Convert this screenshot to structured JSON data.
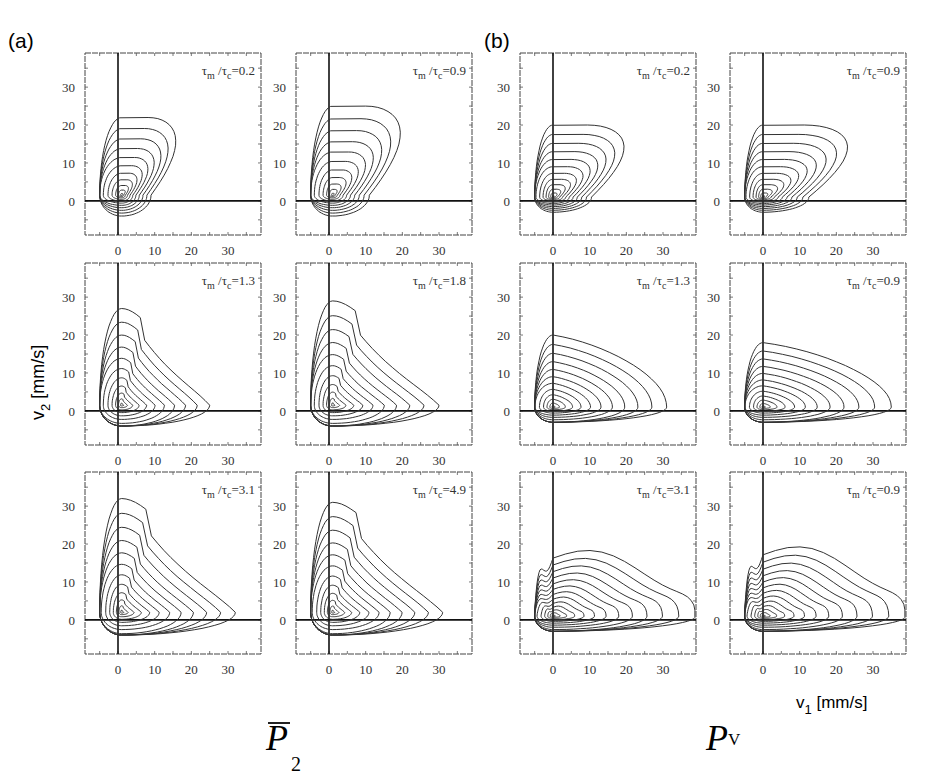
{
  "figure": {
    "panel_a_label": "(a)",
    "panel_b_label": "(b)",
    "ylabel": "v",
    "ylabel_sub": "2",
    "ylabel_unit": " [mm/s]",
    "xlabel": "v",
    "xlabel_sub": "1",
    "xlabel_unit": " [mm/s]",
    "group_a_symbol": "P",
    "group_a_sub": "2",
    "group_b_symbol": "P",
    "group_b_sub": "V"
  },
  "chart_data": {
    "type": "contour",
    "xlim": [
      -9,
      39
    ],
    "ylim": [
      -9,
      39
    ],
    "xticks": [
      0,
      10,
      20,
      30
    ],
    "yticks": [
      0,
      10,
      20,
      30
    ],
    "grid": false,
    "axes_lines": {
      "x": 0,
      "y": 0
    },
    "panels": [
      {
        "group": "a",
        "row": 0,
        "col": 0,
        "title_prefix": "τm/τc=",
        "ratio": "0.2",
        "peak": [
          1,
          1.5
        ],
        "outer": {
          "xmin": -5,
          "xmax": 17,
          "ymin": -4,
          "ymax": 22
        },
        "levels": 11,
        "shape": "diag"
      },
      {
        "group": "a",
        "row": 0,
        "col": 1,
        "title_prefix": "τm/τc=",
        "ratio": "0.9",
        "peak": [
          1,
          1.5
        ],
        "outer": {
          "xmin": -5,
          "xmax": 21,
          "ymin": -4,
          "ymax": 25
        },
        "levels": 11,
        "shape": "diag"
      },
      {
        "group": "a",
        "row": 1,
        "col": 0,
        "title_prefix": "τm/τc=",
        "ratio": "1.3",
        "peak": [
          1,
          1.5
        ],
        "outer": {
          "xmin": -5,
          "xmax": 25,
          "ymin": -4,
          "ymax": 27
        },
        "levels": 11,
        "shape": "tri"
      },
      {
        "group": "a",
        "row": 1,
        "col": 1,
        "title_prefix": "τm/τc=",
        "ratio": "1.8",
        "peak": [
          1,
          1.5
        ],
        "outer": {
          "xmin": -5,
          "xmax": 30,
          "ymin": -4,
          "ymax": 29
        },
        "levels": 11,
        "shape": "tri"
      },
      {
        "group": "a",
        "row": 2,
        "col": 0,
        "title_prefix": "τm/τc=",
        "ratio": "3.1",
        "peak": [
          1,
          2
        ],
        "outer": {
          "xmin": -5,
          "xmax": 32,
          "ymin": -4,
          "ymax": 32
        },
        "levels": 12,
        "shape": "tri"
      },
      {
        "group": "a",
        "row": 2,
        "col": 1,
        "title_prefix": "τm/τc=",
        "ratio": "4.9",
        "peak": [
          1,
          2
        ],
        "outer": {
          "xmin": -5,
          "xmax": 31,
          "ymin": -4,
          "ymax": 31
        },
        "levels": 12,
        "shape": "tri"
      },
      {
        "group": "b",
        "row": 0,
        "col": 0,
        "title_prefix": "τm/τc=",
        "ratio": "0.2",
        "peak": [
          0,
          1
        ],
        "outer": {
          "xmin": -5,
          "xmax": 21,
          "ymin": -3,
          "ymax": 20
        },
        "levels": 12,
        "shape": "diagb"
      },
      {
        "group": "b",
        "row": 0,
        "col": 1,
        "title_prefix": "τm/τc=",
        "ratio": "0.9",
        "peak": [
          0,
          1
        ],
        "outer": {
          "xmin": -5,
          "xmax": 25,
          "ymin": -3,
          "ymax": 20
        },
        "levels": 12,
        "shape": "diagb"
      },
      {
        "group": "b",
        "row": 1,
        "col": 0,
        "title_prefix": "τm/τc=",
        "ratio": "1.3",
        "peak": [
          0,
          1
        ],
        "outer": {
          "xmin": -5,
          "xmax": 31,
          "ymin": -3,
          "ymax": 20
        },
        "levels": 12,
        "shape": "wide"
      },
      {
        "group": "b",
        "row": 1,
        "col": 1,
        "title_prefix": "τm/τc=",
        "ratio": "0.9",
        "peak": [
          0,
          1
        ],
        "outer": {
          "xmin": -5,
          "xmax": 35,
          "ymin": -3,
          "ymax": 18
        },
        "levels": 12,
        "shape": "wide"
      },
      {
        "group": "b",
        "row": 2,
        "col": 0,
        "title_prefix": "τm/τc=",
        "ratio": "3.1",
        "peak": [
          0,
          1
        ],
        "outer": {
          "xmin": -5,
          "xmax": 39,
          "ymin": -3,
          "ymax": 19
        },
        "levels": 13,
        "shape": "flat"
      },
      {
        "group": "b",
        "row": 2,
        "col": 1,
        "title_prefix": "τm/τc=",
        "ratio": "0.9",
        "peak": [
          0,
          1
        ],
        "outer": {
          "xmin": -5,
          "xmax": 39,
          "ymin": -3,
          "ymax": 20
        },
        "levels": 13,
        "shape": "flat"
      }
    ]
  }
}
